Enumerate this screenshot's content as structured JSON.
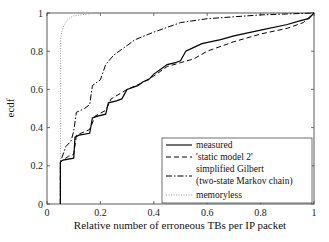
{
  "chart_data": {
    "type": "line",
    "title": "",
    "xlabel": "Relative number of erroneous TBs per IP packet",
    "ylabel": "ecdf",
    "xlim": [
      0,
      1
    ],
    "ylim": [
      0,
      1
    ],
    "xticks": [
      0,
      0.2,
      0.4,
      0.6,
      0.8,
      1
    ],
    "yticks": [
      0,
      0.2,
      0.4,
      0.6,
      0.8,
      1
    ],
    "xtick_labels": [
      "0",
      "0.2",
      "0.4",
      "0.6",
      "0.8",
      "1"
    ],
    "ytick_labels": [
      "0",
      "0.2",
      "0.4",
      "0.6",
      "0.8",
      "1"
    ],
    "grid": false,
    "legend_position": "bottom-right",
    "series": [
      {
        "name": "measured",
        "style": "solid",
        "color": "#000000",
        "points": [
          [
            0.05,
            0
          ],
          [
            0.05,
            0.22
          ],
          [
            0.06,
            0.23
          ],
          [
            0.1,
            0.24
          ],
          [
            0.105,
            0.35
          ],
          [
            0.12,
            0.36
          ],
          [
            0.16,
            0.37
          ],
          [
            0.17,
            0.45
          ],
          [
            0.19,
            0.46
          ],
          [
            0.22,
            0.47
          ],
          [
            0.23,
            0.53
          ],
          [
            0.26,
            0.54
          ],
          [
            0.28,
            0.55
          ],
          [
            0.3,
            0.6
          ],
          [
            0.34,
            0.62
          ],
          [
            0.36,
            0.64
          ],
          [
            0.38,
            0.65
          ],
          [
            0.4,
            0.68
          ],
          [
            0.43,
            0.71
          ],
          [
            0.45,
            0.73
          ],
          [
            0.48,
            0.74
          ],
          [
            0.5,
            0.75
          ],
          [
            0.52,
            0.8
          ],
          [
            0.55,
            0.82
          ],
          [
            0.58,
            0.84
          ],
          [
            0.65,
            0.86
          ],
          [
            0.7,
            0.88
          ],
          [
            0.8,
            0.91
          ],
          [
            0.9,
            0.94
          ],
          [
            0.95,
            0.96
          ],
          [
            0.98,
            0.97
          ],
          [
            1.0,
            1.0
          ]
        ]
      },
      {
        "name": "'static model 2'",
        "style": "dashed",
        "color": "#000000",
        "points": [
          [
            0.05,
            0
          ],
          [
            0.05,
            0.22
          ],
          [
            0.08,
            0.25
          ],
          [
            0.1,
            0.26
          ],
          [
            0.11,
            0.36
          ],
          [
            0.16,
            0.39
          ],
          [
            0.18,
            0.46
          ],
          [
            0.22,
            0.49
          ],
          [
            0.24,
            0.55
          ],
          [
            0.3,
            0.6
          ],
          [
            0.35,
            0.63
          ],
          [
            0.4,
            0.67
          ],
          [
            0.45,
            0.72
          ],
          [
            0.5,
            0.74
          ],
          [
            0.55,
            0.76
          ],
          [
            0.6,
            0.8
          ],
          [
            0.7,
            0.85
          ],
          [
            0.8,
            0.89
          ],
          [
            0.9,
            0.92
          ],
          [
            0.96,
            0.95
          ],
          [
            1.0,
            1.0
          ]
        ]
      },
      {
        "name": "simplified Gilbert (two-state Markov chain)",
        "style": "dashdot",
        "color": "#000000",
        "points": [
          [
            0.05,
            0
          ],
          [
            0.05,
            0.22
          ],
          [
            0.07,
            0.3
          ],
          [
            0.09,
            0.33
          ],
          [
            0.1,
            0.38
          ],
          [
            0.11,
            0.48
          ],
          [
            0.14,
            0.5
          ],
          [
            0.16,
            0.52
          ],
          [
            0.17,
            0.62
          ],
          [
            0.2,
            0.65
          ],
          [
            0.22,
            0.73
          ],
          [
            0.25,
            0.78
          ],
          [
            0.28,
            0.81
          ],
          [
            0.33,
            0.86
          ],
          [
            0.4,
            0.9
          ],
          [
            0.5,
            0.95
          ],
          [
            0.6,
            0.97
          ],
          [
            0.8,
            0.99
          ],
          [
            1.0,
            1.0
          ]
        ]
      },
      {
        "name": "memoryless",
        "style": "dotted",
        "color": "#999999",
        "points": [
          [
            0.05,
            0
          ],
          [
            0.05,
            0.85
          ],
          [
            0.055,
            0.9
          ],
          [
            0.065,
            0.94
          ],
          [
            0.08,
            0.97
          ],
          [
            0.1,
            0.985
          ],
          [
            0.15,
            0.995
          ],
          [
            0.2,
            1.0
          ],
          [
            1.0,
            1.0
          ]
        ]
      }
    ]
  }
}
